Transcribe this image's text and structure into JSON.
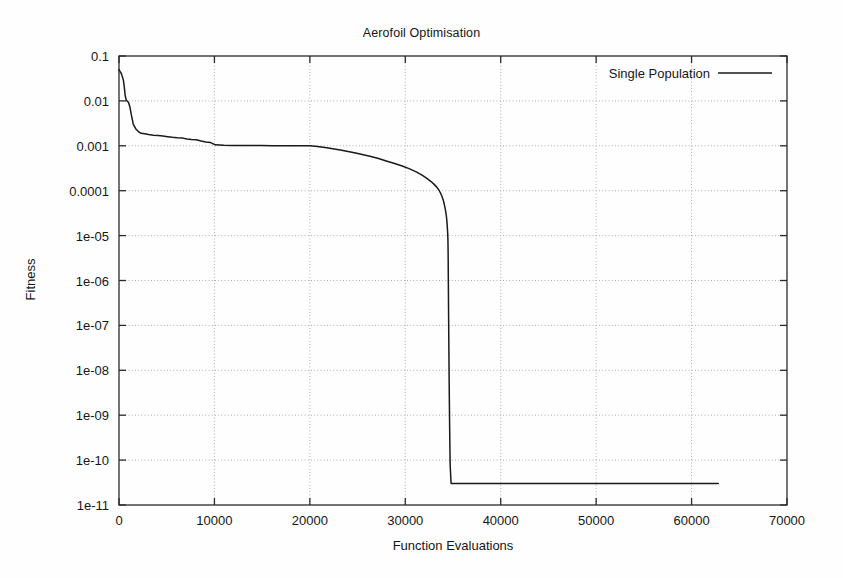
{
  "chart_data": {
    "type": "line",
    "title": "Aerofoil Optimisation",
    "xlabel": "Function Evaluations",
    "ylabel": "Fitness",
    "grid": true,
    "yscale": "log",
    "xscale": "linear",
    "xlim": [
      0,
      70000
    ],
    "ylim": [
      1e-11,
      0.1
    ],
    "xticks": [
      0,
      10000,
      20000,
      30000,
      40000,
      50000,
      60000,
      70000
    ],
    "xtick_labels": [
      "0",
      "10000",
      "20000",
      "30000",
      "40000",
      "50000",
      "60000",
      "70000"
    ],
    "yticks": [
      0.1,
      0.01,
      0.001,
      0.0001,
      1e-05,
      1e-06,
      1e-07,
      1e-08,
      1e-09,
      1e-10,
      1e-11
    ],
    "ytick_labels": [
      "0.1",
      "0.01",
      "0.001",
      "0.0001",
      "1e-05",
      "1e-06",
      "1e-07",
      "1e-08",
      "1e-09",
      "1e-10",
      "1e-11"
    ],
    "legend": {
      "position": "top-right-inside",
      "entries": [
        {
          "name": "Single Population",
          "color": "#1a1a1a"
        }
      ]
    },
    "series": [
      {
        "name": "Single Population",
        "color": "#1a1a1a",
        "x": [
          0,
          120,
          260,
          380,
          470,
          560,
          650,
          760,
          880,
          1000,
          1150,
          1300,
          1500,
          1750,
          2000,
          2300,
          2700,
          3100,
          3600,
          4100,
          4600,
          5100,
          5600,
          6100,
          6600,
          7100,
          7600,
          8100,
          8600,
          9100,
          9600,
          10100,
          11000,
          12000,
          13000,
          14000,
          15000,
          16000,
          17000,
          18000,
          19000,
          20000,
          20800,
          21600,
          22400,
          23200,
          24000,
          24800,
          25600,
          26400,
          27200,
          28000,
          28800,
          29600,
          30400,
          31200,
          31800,
          32300,
          32700,
          33000,
          33300,
          33500,
          33700,
          33850,
          34000,
          34120,
          34220,
          34300,
          34360,
          34400,
          34440,
          34470,
          34490,
          34510,
          34530,
          34560,
          34600,
          34650,
          34700,
          34800,
          35500,
          40000,
          48000,
          55000,
          62800
        ],
        "y": [
          0.05,
          0.045,
          0.04,
          0.033,
          0.028,
          0.02,
          0.013,
          0.0105,
          0.0098,
          0.0092,
          0.0072,
          0.0048,
          0.003,
          0.0024,
          0.0021,
          0.0019,
          0.00185,
          0.00178,
          0.00172,
          0.0017,
          0.00165,
          0.0016,
          0.00155,
          0.00152,
          0.0015,
          0.00142,
          0.00138,
          0.00136,
          0.00128,
          0.00122,
          0.00118,
          0.00105,
          0.00103,
          0.00102,
          0.00102,
          0.00101,
          0.00101,
          0.001,
          0.001,
          0.001,
          0.001,
          0.001,
          0.00097,
          0.00092,
          0.00086,
          0.00081,
          0.00075,
          0.00069,
          0.00063,
          0.00058,
          0.00052,
          0.00046,
          0.00041,
          0.00036,
          0.00031,
          0.00026,
          0.00022,
          0.000185,
          0.00016,
          0.00014,
          0.00012,
          0.000105,
          8.8e-05,
          7.4e-05,
          6e-05,
          4.6e-05,
          3.6e-05,
          2.8e-05,
          2.1e-05,
          1.6e-05,
          1.15e-05,
          8e-06,
          4e-06,
          1.2e-06,
          3e-07,
          5e-08,
          5e-09,
          5e-10,
          8e-11,
          3e-11,
          3e-11,
          3e-11,
          3e-11,
          3e-11,
          3e-11
        ]
      }
    ]
  },
  "plot_geometry": {
    "left": 119,
    "right": 787,
    "top": 56,
    "bottom": 505
  }
}
